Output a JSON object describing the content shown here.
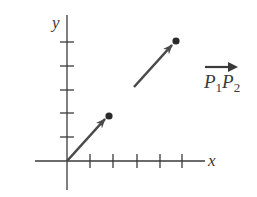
{
  "figure": {
    "type": "vector-diagram",
    "axes": {
      "x_label": "x",
      "y_label": "y",
      "x_ticks": 5,
      "y_ticks": 5
    },
    "vectors": [
      {
        "name": "position-vector",
        "from": [
          0,
          0
        ],
        "to": [
          1.8,
          1.9
        ]
      },
      {
        "name": "vector-P1P2",
        "from": [
          2.85,
          3.15
        ],
        "to": [
          4.6,
          5.1
        ]
      }
    ],
    "points": [
      {
        "name": "endpoint-1",
        "at": [
          1.8,
          1.9
        ]
      },
      {
        "name": "endpoint-2",
        "at": [
          4.6,
          5.1
        ]
      }
    ],
    "vector_label": {
      "p1": "P",
      "sub1": "1",
      "p2": "P",
      "sub2": "2"
    },
    "colors": {
      "axis": "#3a3a3a",
      "vector": "#4a4a4a",
      "point": "#2a2a2a"
    }
  }
}
